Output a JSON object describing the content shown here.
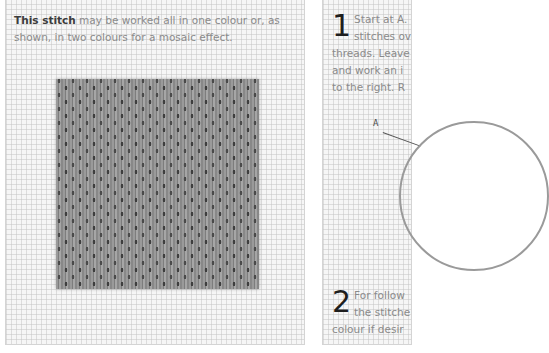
{
  "left_panel": {
    "intro_bold": "This stitch",
    "intro_rest": " may be worked all in one colour or, as shown, in two colours for a mosaic effect.",
    "illustration": "mosaic-stitch-swatch"
  },
  "right_panel": {
    "step1": {
      "number": "1",
      "line1": "Start at A.",
      "line2": "stitches ov",
      "line3": "threads. Leave",
      "line4": "and work an i",
      "line5": "to the right. R"
    },
    "diagram_label": "A",
    "step2": {
      "number": "2",
      "line1": "For follow",
      "line2": "the stitche",
      "line3": "colour if desir"
    }
  },
  "colors": {
    "panel_bg": "#f6f6f6",
    "grid_line": "#c8c8c8",
    "body_text": "#8a8a8a",
    "bold_text": "#3c3c3c",
    "stitch_gray": "#8e8e8e"
  }
}
